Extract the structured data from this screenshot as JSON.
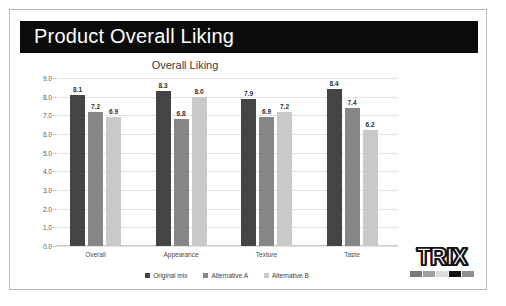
{
  "slide": {
    "title": "Product Overall Liking"
  },
  "chart_data": {
    "type": "bar",
    "title": "Overall Liking",
    "xlabel": "",
    "ylabel": "",
    "ylim": [
      0.0,
      9.0
    ],
    "ytick_labels": [
      "9.0",
      "8.0",
      "7.0",
      "6.0",
      "5.0",
      "4.0",
      "3.0",
      "2.0",
      "1.0",
      "0.0"
    ],
    "ytick_values": [
      9.0,
      8.0,
      7.0,
      6.0,
      5.0,
      4.0,
      3.0,
      2.0,
      1.0,
      0.0
    ],
    "grid": true,
    "legend_position": "bottom",
    "categories": [
      "Overall",
      "Appearance",
      "Texture",
      "Taste"
    ],
    "series": [
      {
        "name": "Original mix",
        "color": "#444444",
        "values": [
          8.1,
          8.3,
          7.9,
          8.4
        ],
        "labels": [
          "8.1",
          "8.3",
          "7.9",
          "8.4"
        ]
      },
      {
        "name": "Alternative A",
        "color": "#868686",
        "values": [
          7.2,
          6.8,
          6.9,
          7.4
        ],
        "labels": [
          "7.2",
          "6.8",
          "6.9",
          "7.4"
        ]
      },
      {
        "name": "Alternative B",
        "color": "#c9c9c9",
        "values": [
          6.9,
          8.0,
          7.2,
          6.2
        ],
        "labels": [
          "6.9",
          "8.0",
          "7.2",
          "6.2"
        ]
      }
    ]
  },
  "logo": {
    "word": "TRIX",
    "swatch_colors": [
      "#7a7a7a",
      "#a0a0a0",
      "#dcdcdc",
      "#101010",
      "#8d8d8d"
    ]
  }
}
